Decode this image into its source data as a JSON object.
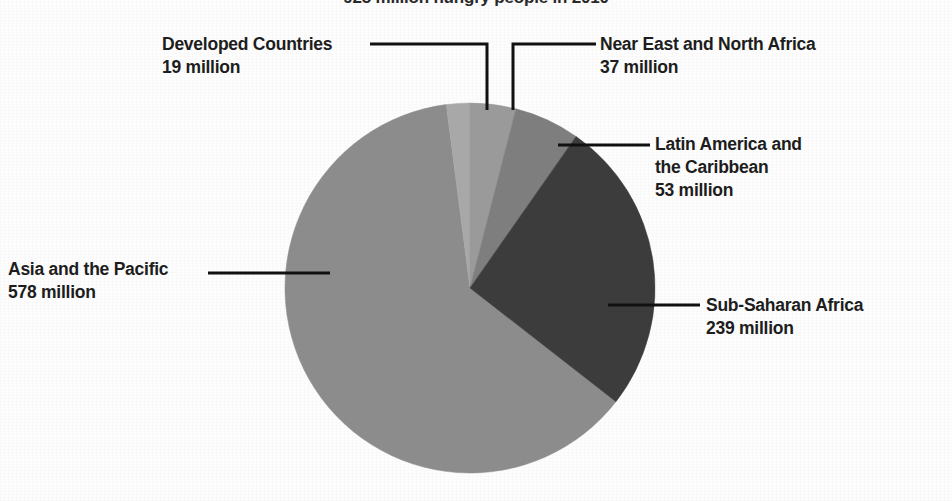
{
  "chart_data": {
    "type": "pie",
    "title": "925 million hungry people in 2010",
    "xlabel": "",
    "ylabel": "",
    "unit": "million",
    "total": 926,
    "legend_position": "callouts",
    "grid": false,
    "categories": [
      "Developed Countries",
      "Near East and North Africa",
      "Latin America and the Caribbean",
      "Sub-Saharan Africa",
      "Asia and the Pacific"
    ],
    "values": [
      19,
      37,
      53,
      239,
      578
    ],
    "labels": [
      "19 million",
      "37 million",
      "53 million",
      "239 million",
      "578 million"
    ],
    "colors": [
      "#a8a8a8",
      "#9a9a9a",
      "#7e7e7e",
      "#3c3c3c",
      "#8c8c8c"
    ],
    "slices": [
      {
        "name": "Developed Countries",
        "value": 19,
        "label": "19 million",
        "color": "#a8a8a8"
      },
      {
        "name": "Near East and North Africa",
        "value": 37,
        "label": "37 million",
        "color": "#9a9a9a"
      },
      {
        "name": "Latin America and the Caribbean",
        "value": 53,
        "label": "53 million",
        "color": "#7e7e7e"
      },
      {
        "name": "Sub-Saharan Africa",
        "value": 239,
        "label": "239 million",
        "color": "#3c3c3c"
      },
      {
        "name": "Asia and the Pacific",
        "value": 578,
        "label": "578 million",
        "color": "#8c8c8c"
      }
    ]
  },
  "title": "925 million hungry people in 2010",
  "callouts": {
    "developed": {
      "name": "Developed Countries",
      "value": "19 million"
    },
    "near_east": {
      "name": "Near East and North Africa",
      "value": "37 million"
    },
    "latin": {
      "name1": "Latin America and",
      "name2": "the Caribbean",
      "value": "53 million"
    },
    "subsaharan": {
      "name": "Sub-Saharan Africa",
      "value": "239 million"
    },
    "asia": {
      "name": "Asia and the Pacific",
      "value": "578 million"
    }
  }
}
